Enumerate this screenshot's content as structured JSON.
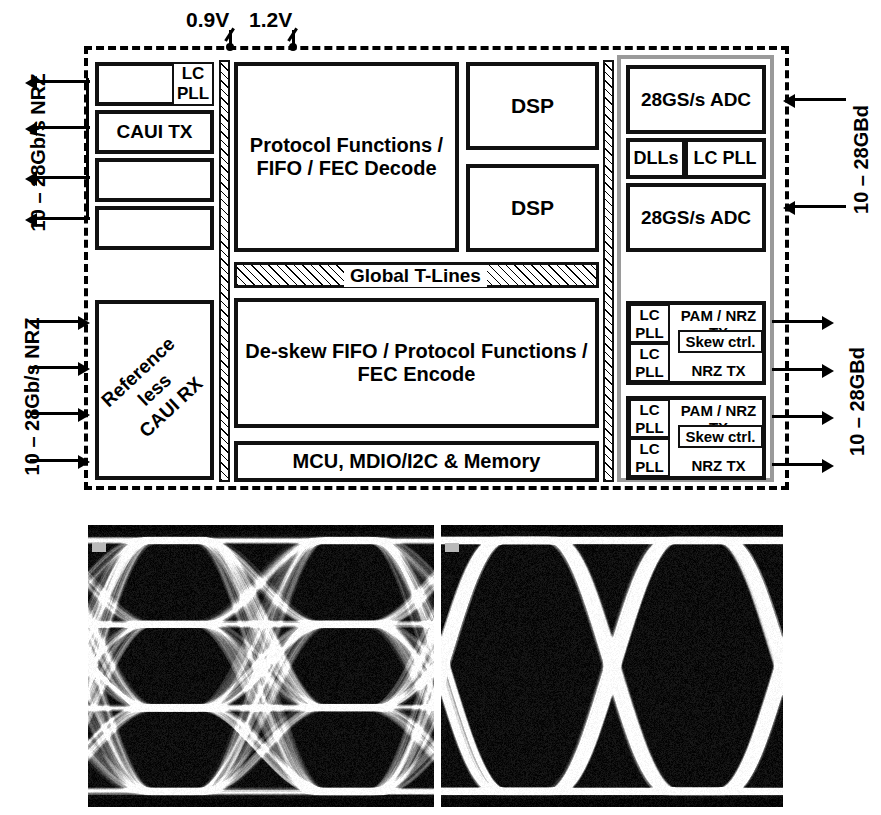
{
  "supplies": [
    {
      "name": "supply-0v9",
      "label": "0.9V"
    },
    {
      "name": "supply-1v2",
      "label": "1.2V"
    }
  ],
  "io_labels": {
    "left_top": "10 – 28Gb/s NRZ",
    "left_bottom": "10 – 28Gb/s NRZ",
    "right_top": "10 – 28GBd",
    "right_bottom": "10 – 28GBd"
  },
  "blocks": {
    "lc_pll_top": "LC\nPLL",
    "caui_tx": "CAUI TX",
    "caui_rx": "Reference less\nCAUI RX",
    "protocol_rx": "Protocol Functions /\nFIFO / FEC Decode",
    "dsp_1": "DSP",
    "dsp_2": "DSP",
    "global_tlines": "Global T-Lines",
    "deskew": "De-skew FIFO / Protocol Functions /\nFEC Encode",
    "mcu": "MCU, MDIO/I2C & Memory",
    "adc_1": "28GS/s ADC",
    "adc_2": "28GS/s ADC",
    "dlls": "DLLs",
    "lc_pll_mid": "LC PLL",
    "tx_lane_pll": "LC\nPLL",
    "pam_nrz_tx": "PAM / NRZ TX",
    "nrz_tx": "NRZ TX",
    "skew_ctrl": "Skew ctrl."
  },
  "eye_diagrams": [
    {
      "name": "pam4-eye-diagram",
      "modulation": "PAM-4",
      "levels": 4,
      "eye_openings": 3,
      "unit_intervals": 2
    },
    {
      "name": "nrz-eye-diagram",
      "modulation": "NRZ",
      "levels": 2,
      "eye_openings": 1,
      "unit_intervals": 2
    }
  ],
  "colors": {
    "ink": "#111111",
    "afe_border": "#9a9a9a",
    "paper": "#ffffff"
  }
}
